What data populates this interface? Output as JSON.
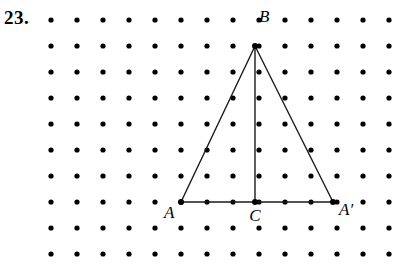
{
  "problem": {
    "number": "23."
  },
  "figure": {
    "type": "dot-lattice-geometry",
    "colors": {
      "dot": "#000000",
      "line": "#1a1a1a",
      "background": "#ffffff",
      "text": "#000000"
    },
    "lattice": {
      "origin_x": 51,
      "origin_y": 20,
      "spacing_x": 26,
      "spacing_y": 26,
      "columns": 14,
      "rows": 10,
      "dot_radius": 2.6
    },
    "vertices": [
      {
        "name": "A",
        "label": "A",
        "x": 181,
        "y": 202,
        "label_x": 164,
        "label_y": 218,
        "label_anchor": "start"
      },
      {
        "name": "B",
        "label": "B",
        "x": 255,
        "y": 46,
        "label_x": 259,
        "label_y": 22,
        "label_anchor": "start"
      },
      {
        "name": "C",
        "label": "C",
        "x": 255,
        "y": 202,
        "label_x": 255,
        "label_y": 221,
        "label_anchor": "middle"
      },
      {
        "name": "Aprime",
        "label": "A′",
        "x": 333,
        "y": 202,
        "label_x": 339,
        "label_y": 215,
        "label_anchor": "start"
      }
    ],
    "segments": [
      {
        "name": "side-AB",
        "x1": 181,
        "y1": 202,
        "x2": 255,
        "y2": 46
      },
      {
        "name": "side-BAprime",
        "x1": 255,
        "y1": 46,
        "x2": 333,
        "y2": 202
      },
      {
        "name": "base-AAprime",
        "x1": 181,
        "y1": 202,
        "x2": 333,
        "y2": 202
      },
      {
        "name": "altitude-BC",
        "x1": 255,
        "y1": 46,
        "x2": 255,
        "y2": 202
      }
    ],
    "line_width": 1.4
  }
}
